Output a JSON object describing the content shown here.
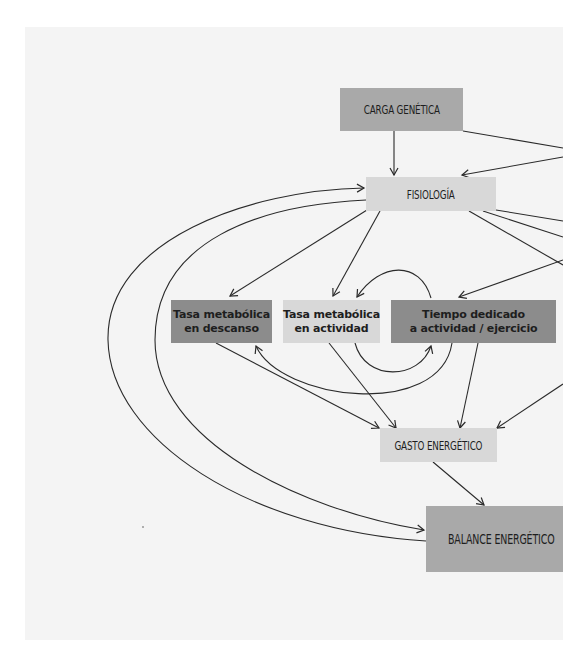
{
  "diagram": {
    "nodes": {
      "carga_genetica": {
        "label": "CARGA GENÉTICA",
        "color": "#a9a9a9"
      },
      "fisiologia": {
        "label": "FISIOLOGÍA",
        "color": "#d8d8d8"
      },
      "tasa_descanso": {
        "line1": "Tasa metabólica",
        "line2": "en descanso",
        "color": "#8c8c8c"
      },
      "tasa_actividad": {
        "line1": "Tasa metabólica",
        "line2": "en actividad",
        "color": "#d8d8d8"
      },
      "tiempo_actividad": {
        "line1": "Tiempo dedicado",
        "line2": "a actividad / ejercicio",
        "color": "#8c8c8c"
      },
      "gasto_energetico": {
        "label": "GASTO ENERGÉTICO",
        "color": "#d8d8d8"
      },
      "balance_energetico": {
        "label": "BALANCE ENERGÉTICO",
        "color": "#a9a9a9"
      }
    },
    "edges": [
      {
        "from": "carga_genetica",
        "to": "fisiologia"
      },
      {
        "from": "carga_genetica",
        "to": "offscreen-right"
      },
      {
        "from": "offscreen-right",
        "to": "fisiologia"
      },
      {
        "from": "fisiologia",
        "to": "tasa_descanso"
      },
      {
        "from": "fisiologia",
        "to": "tasa_actividad"
      },
      {
        "from": "fisiologia",
        "to": "offscreen-right"
      },
      {
        "from": "offscreen-right",
        "to": "tiempo_actividad"
      },
      {
        "from": "tasa_actividad",
        "to": "tiempo_actividad"
      },
      {
        "from": "tiempo_actividad",
        "to": "tasa_actividad"
      },
      {
        "from": "tiempo_actividad",
        "to": "tasa_descanso"
      },
      {
        "from": "tasa_descanso",
        "to": "gasto_energetico"
      },
      {
        "from": "tasa_actividad",
        "to": "gasto_energetico"
      },
      {
        "from": "tiempo_actividad",
        "to": "gasto_energetico"
      },
      {
        "from": "offscreen-right",
        "to": "gasto_energetico"
      },
      {
        "from": "gasto_energetico",
        "to": "balance_energetico"
      },
      {
        "from": "fisiologia",
        "to": "balance_energetico"
      },
      {
        "from": "balance_energetico",
        "to": "fisiologia"
      }
    ]
  }
}
